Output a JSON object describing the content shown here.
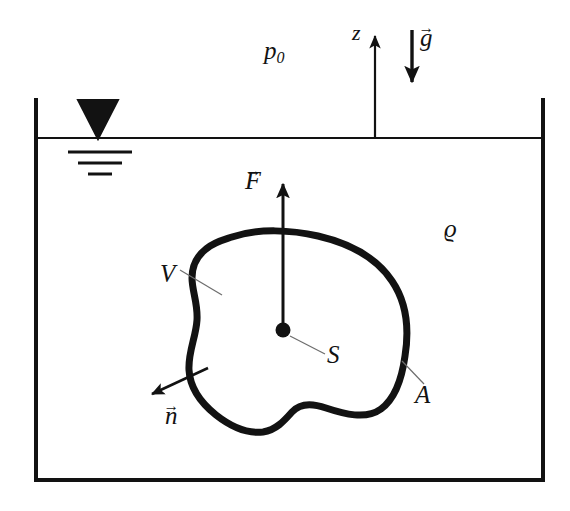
{
  "figure": {
    "background_color": "#ffffff",
    "ink_color": "#121212"
  },
  "labels": {
    "ambient_pressure": "p",
    "ambient_pressure_subscript": "0",
    "z_axis": "z",
    "gravity": "g",
    "density": "ϱ",
    "force": "F",
    "volume": "V",
    "centroid": "S",
    "surface_area": "A",
    "normal": "n",
    "vector_arrow": "→"
  },
  "vectors": {
    "buoyant_force": {
      "name": "F",
      "direction": "up",
      "tail": [
        283,
        330
      ],
      "head": [
        283,
        180
      ],
      "has_arrow_accent": true
    },
    "gravity": {
      "name": "g",
      "direction": "down",
      "tail": [
        412,
        30
      ],
      "head": [
        412,
        85
      ],
      "has_arrow_accent": true
    },
    "z_axis": {
      "name": "z",
      "direction": "up",
      "tail": [
        375,
        138
      ],
      "head": [
        375,
        33
      ],
      "has_arrow_accent": false
    },
    "outward_normal": {
      "name": "n",
      "direction": "down-left",
      "tail": [
        208,
        368
      ],
      "head": [
        148,
        396
      ],
      "has_arrow_accent": true
    }
  },
  "tank": {
    "left_wall_x": 36,
    "right_wall_x": 543,
    "top_y": 100,
    "bottom_y": 480,
    "wall_stroke_width": 4
  },
  "free_surface": {
    "y": 138,
    "left_x": 36,
    "right_x": 543,
    "stroke_width": 2,
    "symbol": {
      "name": "water-level-symbol",
      "triangle_apex": [
        98,
        138
      ],
      "triangle_top_left": [
        78,
        100
      ],
      "triangle_top_right": [
        118,
        100
      ],
      "hatch_lines": [
        {
          "x1": 68,
          "x2": 132,
          "y": 152
        },
        {
          "x1": 78,
          "x2": 122,
          "y": 163
        },
        {
          "x1": 88,
          "x2": 112,
          "y": 174
        }
      ]
    }
  },
  "body": {
    "name": "submerged-body",
    "stroke_width": 7,
    "centroid_dot": {
      "cx": 283,
      "cy": 330,
      "r": 7
    },
    "outline_path": "M 232 237 C 258 228 292 230 318 236 C 348 243 376 257 392 281 C 407 303 409 331 405 356 C 402 378 396 398 381 409 C 366 420 344 414 326 408 C 312 403 300 403 292 412 C 284 421 276 430 263 432 C 246 434 230 426 216 415 C 201 403 190 388 189 370 C 188 352 196 337 197 320 C 198 303 192 291 192 278 C 192 266 197 256 206 249 C 214 242 223 240 232 237 Z"
  },
  "leader_lines": [
    {
      "name": "leader-V",
      "x1": 180,
      "y1": 270,
      "x2": 222,
      "y2": 295
    },
    {
      "name": "leader-S",
      "x1": 290,
      "y1": 336,
      "x2": 325,
      "y2": 354
    },
    {
      "name": "leader-A",
      "x1": 402,
      "y1": 361,
      "x2": 424,
      "y2": 384
    }
  ]
}
